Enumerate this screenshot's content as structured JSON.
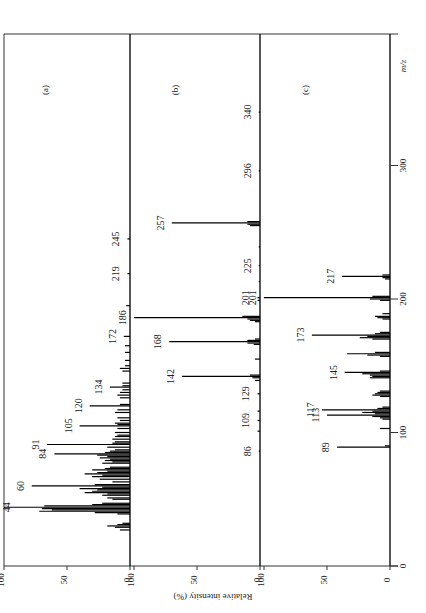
{
  "chart_data": [
    {
      "type": "bar",
      "panel_label": "(a)",
      "title": "",
      "xlabel": "m/z",
      "ylabel": "Relative intensity (%)",
      "xlim": [
        0,
        400
      ],
      "ylim": [
        0,
        100
      ],
      "peaks": [
        {
          "mz": 27,
          "i": 8
        },
        {
          "mz": 29,
          "i": 12
        },
        {
          "mz": 30,
          "i": 18
        },
        {
          "mz": 31,
          "i": 10
        },
        {
          "mz": 32,
          "i": 6
        },
        {
          "mz": 39,
          "i": 10
        },
        {
          "mz": 40,
          "i": 28
        },
        {
          "mz": 41,
          "i": 72
        },
        {
          "mz": 42,
          "i": 62
        },
        {
          "mz": 43,
          "i": 70
        },
        {
          "mz": 44,
          "i": 100
        },
        {
          "mz": 45,
          "i": 68
        },
        {
          "mz": 46,
          "i": 30
        },
        {
          "mz": 47,
          "i": 22
        },
        {
          "mz": 50,
          "i": 14
        },
        {
          "mz": 51,
          "i": 18
        },
        {
          "mz": 53,
          "i": 22
        },
        {
          "mz": 54,
          "i": 18
        },
        {
          "mz": 55,
          "i": 36
        },
        {
          "mz": 56,
          "i": 30
        },
        {
          "mz": 57,
          "i": 26
        },
        {
          "mz": 58,
          "i": 40
        },
        {
          "mz": 59,
          "i": 22
        },
        {
          "mz": 60,
          "i": 78
        },
        {
          "mz": 61,
          "i": 28
        },
        {
          "mz": 63,
          "i": 14
        },
        {
          "mz": 65,
          "i": 24
        },
        {
          "mz": 67,
          "i": 30
        },
        {
          "mz": 68,
          "i": 22
        },
        {
          "mz": 69,
          "i": 36
        },
        {
          "mz": 70,
          "i": 26
        },
        {
          "mz": 71,
          "i": 18
        },
        {
          "mz": 72,
          "i": 30
        },
        {
          "mz": 73,
          "i": 20
        },
        {
          "mz": 74,
          "i": 16
        },
        {
          "mz": 77,
          "i": 22
        },
        {
          "mz": 78,
          "i": 14
        },
        {
          "mz": 79,
          "i": 20
        },
        {
          "mz": 80,
          "i": 16
        },
        {
          "mz": 81,
          "i": 24
        },
        {
          "mz": 82,
          "i": 18
        },
        {
          "mz": 83,
          "i": 26
        },
        {
          "mz": 84,
          "i": 60
        },
        {
          "mz": 85,
          "i": 20
        },
        {
          "mz": 86,
          "i": 16
        },
        {
          "mz": 87,
          "i": 12
        },
        {
          "mz": 89,
          "i": 18
        },
        {
          "mz": 91,
          "i": 66
        },
        {
          "mz": 92,
          "i": 14
        },
        {
          "mz": 93,
          "i": 12
        },
        {
          "mz": 95,
          "i": 14
        },
        {
          "mz": 97,
          "i": 12
        },
        {
          "mz": 98,
          "i": 10
        },
        {
          "mz": 100,
          "i": 12
        },
        {
          "mz": 103,
          "i": 10
        },
        {
          "mz": 105,
          "i": 40
        },
        {
          "mz": 106,
          "i": 10
        },
        {
          "mz": 107,
          "i": 12
        },
        {
          "mz": 109,
          "i": 8
        },
        {
          "mz": 111,
          "i": 10
        },
        {
          "mz": 115,
          "i": 12
        },
        {
          "mz": 117,
          "i": 10
        },
        {
          "mz": 120,
          "i": 32
        },
        {
          "mz": 121,
          "i": 8
        },
        {
          "mz": 126,
          "i": 8
        },
        {
          "mz": 128,
          "i": 10
        },
        {
          "mz": 130,
          "i": 8
        },
        {
          "mz": 132,
          "i": 6
        },
        {
          "mz": 134,
          "i": 16
        },
        {
          "mz": 135,
          "i": 6
        },
        {
          "mz": 137,
          "i": 6
        },
        {
          "mz": 146,
          "i": 6
        },
        {
          "mz": 148,
          "i": 8
        },
        {
          "mz": 150,
          "i": 4
        },
        {
          "mz": 154,
          "i": 4
        },
        {
          "mz": 160,
          "i": 4
        },
        {
          "mz": 165,
          "i": 4
        },
        {
          "mz": 172,
          "i": 5
        },
        {
          "mz": 195,
          "i": 3
        },
        {
          "mz": 219,
          "i": 2
        },
        {
          "mz": 245,
          "i": 2
        }
      ],
      "labels": [
        {
          "mz": 44,
          "text": "44"
        },
        {
          "mz": 60,
          "text": "60"
        },
        {
          "mz": 84,
          "text": "84"
        },
        {
          "mz": 91,
          "text": "91"
        },
        {
          "mz": 105,
          "text": "105"
        },
        {
          "mz": 120,
          "text": "120"
        },
        {
          "mz": 134,
          "text": "134"
        },
        {
          "mz": 172,
          "text": "172"
        },
        {
          "mz": 219,
          "text": "219"
        },
        {
          "mz": 245,
          "text": "245"
        }
      ]
    },
    {
      "type": "bar",
      "panel_label": "(b)",
      "title": "",
      "xlabel": "m/z",
      "ylabel": "Relative intensity (%)",
      "xlim": [
        0,
        400
      ],
      "ylim": [
        0,
        100
      ],
      "peaks": [
        {
          "mz": 86,
          "i": 1
        },
        {
          "mz": 101,
          "i": 2
        },
        {
          "mz": 109,
          "i": 2
        },
        {
          "mz": 116,
          "i": 2
        },
        {
          "mz": 129,
          "i": 2
        },
        {
          "mz": 139,
          "i": 4
        },
        {
          "mz": 141,
          "i": 6
        },
        {
          "mz": 142,
          "i": 62
        },
        {
          "mz": 143,
          "i": 8
        },
        {
          "mz": 155,
          "i": 4
        },
        {
          "mz": 166,
          "i": 5
        },
        {
          "mz": 167,
          "i": 10
        },
        {
          "mz": 168,
          "i": 72
        },
        {
          "mz": 169,
          "i": 10
        },
        {
          "mz": 170,
          "i": 4
        },
        {
          "mz": 183,
          "i": 4
        },
        {
          "mz": 184,
          "i": 8
        },
        {
          "mz": 185,
          "i": 10
        },
        {
          "mz": 186,
          "i": 100
        },
        {
          "mz": 187,
          "i": 14
        },
        {
          "mz": 199,
          "i": 2
        },
        {
          "mz": 201,
          "i": 2
        },
        {
          "mz": 213,
          "i": 1
        },
        {
          "mz": 225,
          "i": 1
        },
        {
          "mz": 239,
          "i": 1
        },
        {
          "mz": 255,
          "i": 8
        },
        {
          "mz": 256,
          "i": 10
        },
        {
          "mz": 257,
          "i": 70
        },
        {
          "mz": 258,
          "i": 10
        },
        {
          "mz": 296,
          "i": 1
        },
        {
          "mz": 340,
          "i": 1
        }
      ],
      "labels": [
        {
          "mz": 86,
          "text": "86"
        },
        {
          "mz": 109,
          "text": "109"
        },
        {
          "mz": 129,
          "text": "129"
        },
        {
          "mz": 142,
          "text": "142"
        },
        {
          "mz": 168,
          "text": "168"
        },
        {
          "mz": 186,
          "text": "186"
        },
        {
          "mz": 201,
          "text": "201"
        },
        {
          "mz": 225,
          "text": "225"
        },
        {
          "mz": 257,
          "text": "257"
        },
        {
          "mz": 296,
          "text": "296"
        },
        {
          "mz": 340,
          "text": "340"
        }
      ]
    },
    {
      "type": "bar",
      "panel_label": "(c)",
      "title": "",
      "xlabel": "m/z",
      "ylabel": "Relative intensity (%)",
      "xlim": [
        0,
        400
      ],
      "ylim": [
        0,
        100
      ],
      "peaks": [
        {
          "mz": 89,
          "i": 42
        },
        {
          "mz": 90,
          "i": 4
        },
        {
          "mz": 103,
          "i": 8
        },
        {
          "mz": 110,
          "i": 6
        },
        {
          "mz": 111,
          "i": 8
        },
        {
          "mz": 112,
          "i": 14
        },
        {
          "mz": 113,
          "i": 50
        },
        {
          "mz": 114,
          "i": 12
        },
        {
          "mz": 115,
          "i": 22
        },
        {
          "mz": 116,
          "i": 14
        },
        {
          "mz": 117,
          "i": 54
        },
        {
          "mz": 118,
          "i": 10
        },
        {
          "mz": 119,
          "i": 6
        },
        {
          "mz": 127,
          "i": 8
        },
        {
          "mz": 128,
          "i": 14
        },
        {
          "mz": 129,
          "i": 12
        },
        {
          "mz": 130,
          "i": 10
        },
        {
          "mz": 131,
          "i": 8
        },
        {
          "mz": 141,
          "i": 16
        },
        {
          "mz": 142,
          "i": 14
        },
        {
          "mz": 143,
          "i": 16
        },
        {
          "mz": 144,
          "i": 22
        },
        {
          "mz": 145,
          "i": 36
        },
        {
          "mz": 146,
          "i": 8
        },
        {
          "mz": 157,
          "i": 8
        },
        {
          "mz": 158,
          "i": 18
        },
        {
          "mz": 159,
          "i": 34
        },
        {
          "mz": 160,
          "i": 12
        },
        {
          "mz": 170,
          "i": 14
        },
        {
          "mz": 171,
          "i": 24
        },
        {
          "mz": 172,
          "i": 18
        },
        {
          "mz": 173,
          "i": 62
        },
        {
          "mz": 174,
          "i": 12
        },
        {
          "mz": 175,
          "i": 8
        },
        {
          "mz": 185,
          "i": 6
        },
        {
          "mz": 186,
          "i": 10
        },
        {
          "mz": 187,
          "i": 12
        },
        {
          "mz": 189,
          "i": 6
        },
        {
          "mz": 199,
          "i": 8
        },
        {
          "mz": 200,
          "i": 16
        },
        {
          "mz": 201,
          "i": 100
        },
        {
          "mz": 202,
          "i": 14
        },
        {
          "mz": 215,
          "i": 4
        },
        {
          "mz": 216,
          "i": 6
        },
        {
          "mz": 217,
          "i": 38
        },
        {
          "mz": 218,
          "i": 6
        }
      ],
      "labels": [
        {
          "mz": 89,
          "text": "89"
        },
        {
          "mz": 113,
          "text": "113"
        },
        {
          "mz": 117,
          "text": "117"
        },
        {
          "mz": 145,
          "text": "145"
        },
        {
          "mz": 173,
          "text": "173"
        },
        {
          "mz": 201,
          "text": "201"
        },
        {
          "mz": 217,
          "text": "217"
        }
      ]
    }
  ],
  "axes": {
    "intensity_ticks": [
      "100",
      "50",
      "0"
    ],
    "intensity_label": "Relative intensity (%)",
    "mz_ticks": [
      "0",
      "100",
      "200",
      "300"
    ],
    "mz_label": "m/z"
  }
}
